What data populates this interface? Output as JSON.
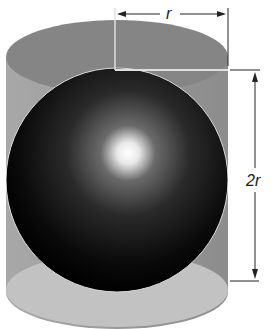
{
  "diagram": {
    "labels": {
      "radius": "r",
      "height": "2r"
    },
    "colors": {
      "cylinder_top": "#8a8a8a",
      "cylinder_side": "#9e9e9e",
      "cylinder_bottom": "#c4c4c4",
      "sphere_dark": "#050505",
      "sphere_highlight": "#ffffff",
      "dimension_line": "#222222"
    }
  }
}
